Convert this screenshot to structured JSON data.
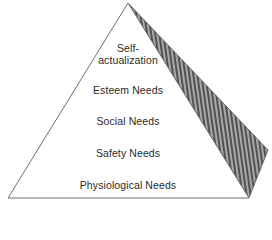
{
  "diagram": {
    "type": "pyramid",
    "levels_top_to_bottom": [
      {
        "id": "self-actualization",
        "lines": [
          "Self-",
          "actualization"
        ]
      },
      {
        "id": "esteem",
        "lines": [
          "Esteem Needs"
        ]
      },
      {
        "id": "social",
        "lines": [
          "Social Needs"
        ]
      },
      {
        "id": "safety",
        "lines": [
          "Safety Needs"
        ]
      },
      {
        "id": "physiological",
        "lines": [
          "Physiological Needs"
        ]
      }
    ],
    "colors": {
      "front_face": "#ffffff",
      "outline": "#6e6e6e",
      "side_face_hatch": "#3c3c3c",
      "side_face_bg": "#9a9a9a",
      "text": "#2a2a2a"
    }
  }
}
